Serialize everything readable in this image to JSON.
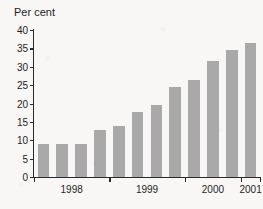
{
  "chart_data": {
    "type": "bar",
    "title": "",
    "subtitle": "",
    "xlabel": "",
    "ylabel": "Per cent",
    "ylim": [
      0,
      40
    ],
    "ytick_labels": [
      "0",
      "5",
      "10",
      "15",
      "20",
      "25",
      "30",
      "35",
      "40"
    ],
    "ytick_values": [
      0,
      5,
      10,
      15,
      20,
      25,
      30,
      35,
      40
    ],
    "grid": false,
    "legend": false,
    "bar_color": "#a9a9a9",
    "axis_color": "#2a2a2a",
    "background_color": "#f8f7f5",
    "categories": [
      "1998 Q1",
      "1998 Q2",
      "1998 Q3",
      "1998 Q4",
      "1999 Q1",
      "1999 Q2",
      "1999 Q3",
      "1999 Q4",
      "2000 Q1",
      "2000 Q2",
      "2000 Q3",
      "2001 Q1"
    ],
    "values": [
      9.0,
      9.0,
      9.0,
      12.7,
      13.8,
      17.7,
      19.7,
      24.5,
      26.5,
      31.5,
      34.5,
      36.5
    ],
    "x_group_labels": [
      "1998",
      "1999",
      "2000",
      "2001"
    ]
  },
  "axis": {
    "ylabel": "Per cent"
  }
}
